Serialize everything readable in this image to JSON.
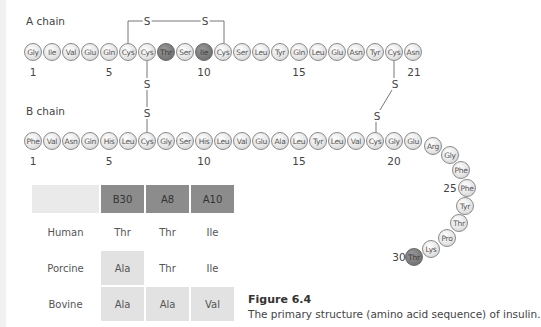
{
  "a_chain": {
    "label": "A chain",
    "residues": [
      "Gly",
      "Ile",
      "Val",
      "Glu",
      "Gln",
      "Cys",
      "Cys",
      "Thr",
      "Ser",
      "Ile",
      "Cys",
      "Ser",
      "Leu",
      "Tyr",
      "Gln",
      "Leu",
      "Glu",
      "Asn",
      "Tyr",
      "Cys",
      "Asn"
    ],
    "highlighted": [
      8,
      10
    ],
    "position_labels": [
      "1",
      "5",
      "10",
      "15",
      "21"
    ]
  },
  "b_chain": {
    "label": "B chain",
    "residues": [
      "Phe",
      "Val",
      "Asn",
      "Gln",
      "His",
      "Leu",
      "Cys",
      "Gly",
      "Ser",
      "His",
      "Leu",
      "Val",
      "Glu",
      "Ala",
      "Leu",
      "Tyr",
      "Leu",
      "Val",
      "Cys",
      "Gly",
      "Glu",
      "Arg",
      "Gly",
      "Phe",
      "Phe",
      "Tyr",
      "Thr",
      "Pro",
      "Lys",
      "Thr"
    ],
    "highlighted": [
      30
    ],
    "position_labels": [
      "1",
      "5",
      "10",
      "15",
      "20",
      "25",
      "30"
    ]
  },
  "disulfide_bonds": {
    "symbol": "S",
    "bonds": [
      "A6-A11",
      "A7-B7",
      "A20-B19"
    ]
  },
  "table": {
    "headers": [
      "",
      "B30",
      "A8",
      "A10"
    ],
    "rows": [
      {
        "species": "Human",
        "values": [
          "Thr",
          "Thr",
          "Ile"
        ]
      },
      {
        "species": "Porcine",
        "values": [
          "Ala",
          "Thr",
          "Ile"
        ]
      },
      {
        "species": "Bovine",
        "values": [
          "Ala",
          "Ala",
          "Val"
        ]
      }
    ]
  },
  "figure": {
    "title": "Figure 6.4",
    "caption": "The primary structure (amino acid sequence) of insulin."
  },
  "colors": {
    "bead_light": "#e6e6e6",
    "bead_dark": "#7a7a7a",
    "table_header": "#8c8c8c",
    "table_highlight": "#e2e2e2"
  }
}
